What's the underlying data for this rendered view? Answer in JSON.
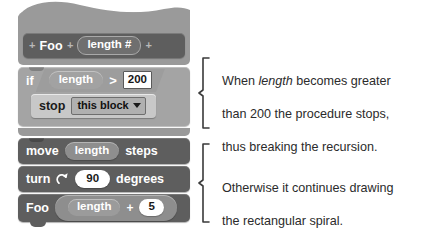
{
  "script": {
    "hat": {
      "plus_left": "+",
      "name": "Foo",
      "plus_mid": "+",
      "param": "length #",
      "plus_right": "+"
    },
    "if_block": {
      "keyword": "if",
      "condition": {
        "left_operand": "length",
        "operator": ">",
        "right_operand": "200"
      },
      "body": {
        "stop": {
          "keyword": "stop",
          "option": "this block",
          "caret_icon": "chevron-down-icon"
        }
      }
    },
    "move_block": {
      "keyword": "move",
      "operand": "length",
      "suffix": "steps"
    },
    "turn_block": {
      "keyword": "turn",
      "icon": "turn-clockwise-icon",
      "operand": "90",
      "suffix": "degrees"
    },
    "call_block": {
      "name": "Foo",
      "left_operand": "length",
      "operator": "+",
      "right_operand": "5"
    }
  },
  "annotations": [
    {
      "id": "annotation-stop-case",
      "line1_a": "When ",
      "line1_em": "length",
      "line1_b": " becomes greater",
      "line2": "than 200 the procedure stops,",
      "line3": "thus breaking the recursion."
    },
    {
      "id": "annotation-recursive-case",
      "line1": "Otherwise it continues drawing",
      "line2": "the rectangular spiral."
    }
  ],
  "colors": {
    "background": "#ffffff",
    "block_dark": "#5e5e5e",
    "block_mid": "#8d8d8d",
    "block_light": "#c8c8c8",
    "hat_body": "#9a9a9a",
    "text_dark": "#2b2b2b"
  }
}
